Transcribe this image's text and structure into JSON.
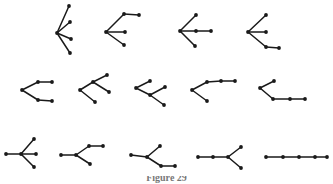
{
  "figure": {
    "caption": "Figure 29",
    "background_color": "#ffffff",
    "ink_color": "#1a1a1a",
    "node_radius": 1.9,
    "edge_width": 1.5,
    "rows": [
      {
        "row_index": 0,
        "tree_count": 4,
        "trees": [
          {
            "id": "tree-1",
            "name": "star-5-branches",
            "nodes": [
              {
                "id": "c",
                "x": 57,
                "y": 33
              },
              {
                "id": "a",
                "x": 69,
                "y": 6
              },
              {
                "id": "b",
                "x": 70,
                "y": 22
              },
              {
                "id": "d",
                "x": 71,
                "y": 39
              },
              {
                "id": "e",
                "x": 70,
                "y": 53
              }
            ],
            "edges": [
              [
                "c",
                "a"
              ],
              [
                "c",
                "b"
              ],
              [
                "c",
                "d"
              ],
              [
                "c",
                "e"
              ]
            ]
          },
          {
            "id": "tree-2",
            "name": "center-three-branches-one-extended-up",
            "nodes": [
              {
                "id": "c",
                "x": 106,
                "y": 32
              },
              {
                "id": "p",
                "x": 124,
                "y": 14
              },
              {
                "id": "q",
                "x": 139,
                "y": 15
              },
              {
                "id": "r",
                "x": 125,
                "y": 32
              },
              {
                "id": "s",
                "x": 124,
                "y": 45
              }
            ],
            "edges": [
              [
                "c",
                "p"
              ],
              [
                "p",
                "q"
              ],
              [
                "c",
                "r"
              ],
              [
                "c",
                "s"
              ]
            ]
          },
          {
            "id": "tree-3",
            "name": "center-three-branches-one-extended-right",
            "nodes": [
              {
                "id": "c",
                "x": 180,
                "y": 31
              },
              {
                "id": "p",
                "x": 196,
                "y": 15
              },
              {
                "id": "r",
                "x": 196,
                "y": 31
              },
              {
                "id": "q",
                "x": 211,
                "y": 31
              },
              {
                "id": "s",
                "x": 195,
                "y": 46
              }
            ],
            "edges": [
              [
                "c",
                "p"
              ],
              [
                "c",
                "r"
              ],
              [
                "r",
                "q"
              ],
              [
                "c",
                "s"
              ]
            ]
          },
          {
            "id": "tree-4",
            "name": "center-three-branches-one-extended-down",
            "nodes": [
              {
                "id": "c",
                "x": 248,
                "y": 32
              },
              {
                "id": "p",
                "x": 266,
                "y": 15
              },
              {
                "id": "r",
                "x": 266,
                "y": 32
              },
              {
                "id": "s",
                "x": 266,
                "y": 47
              },
              {
                "id": "t",
                "x": 279,
                "y": 48
              }
            ],
            "edges": [
              [
                "c",
                "p"
              ],
              [
                "c",
                "r"
              ],
              [
                "c",
                "s"
              ],
              [
                "s",
                "t"
              ]
            ]
          }
        ]
      },
      {
        "row_index": 1,
        "tree_count": 5,
        "trees": [
          {
            "id": "tree-5",
            "name": "double-fork-both-extended",
            "nodes": [
              {
                "id": "c",
                "x": 22,
                "y": 90
              },
              {
                "id": "a",
                "x": 38,
                "y": 82
              },
              {
                "id": "b",
                "x": 52,
                "y": 82
              },
              {
                "id": "d",
                "x": 38,
                "y": 100
              },
              {
                "id": "e",
                "x": 52,
                "y": 101
              }
            ],
            "edges": [
              [
                "c",
                "a"
              ],
              [
                "a",
                "b"
              ],
              [
                "c",
                "d"
              ],
              [
                "d",
                "e"
              ]
            ]
          },
          {
            "id": "tree-6",
            "name": "fork-upper-split",
            "nodes": [
              {
                "id": "c",
                "x": 80,
                "y": 90
              },
              {
                "id": "m",
                "x": 93,
                "y": 82
              },
              {
                "id": "u",
                "x": 107,
                "y": 75
              },
              {
                "id": "v",
                "x": 109,
                "y": 92
              },
              {
                "id": "d",
                "x": 95,
                "y": 102
              }
            ],
            "edges": [
              [
                "c",
                "m"
              ],
              [
                "m",
                "u"
              ],
              [
                "m",
                "v"
              ],
              [
                "c",
                "d"
              ]
            ]
          },
          {
            "id": "tree-7",
            "name": "fork-lower-split",
            "nodes": [
              {
                "id": "c",
                "x": 136,
                "y": 88
              },
              {
                "id": "a",
                "x": 150,
                "y": 81
              },
              {
                "id": "m",
                "x": 150,
                "y": 95
              },
              {
                "id": "u",
                "x": 165,
                "y": 87
              },
              {
                "id": "v",
                "x": 164,
                "y": 105
              }
            ],
            "edges": [
              [
                "c",
                "a"
              ],
              [
                "c",
                "m"
              ],
              [
                "m",
                "u"
              ],
              [
                "m",
                "v"
              ]
            ]
          },
          {
            "id": "tree-8",
            "name": "fork-long-upper-path",
            "nodes": [
              {
                "id": "c",
                "x": 192,
                "y": 90
              },
              {
                "id": "a",
                "x": 207,
                "y": 82
              },
              {
                "id": "b",
                "x": 221,
                "y": 81
              },
              {
                "id": "e",
                "x": 235,
                "y": 81
              },
              {
                "id": "d",
                "x": 207,
                "y": 101
              }
            ],
            "edges": [
              [
                "c",
                "a"
              ],
              [
                "a",
                "b"
              ],
              [
                "b",
                "e"
              ],
              [
                "c",
                "d"
              ]
            ]
          },
          {
            "id": "tree-9",
            "name": "fork-long-lower-path",
            "nodes": [
              {
                "id": "c",
                "x": 260,
                "y": 88
              },
              {
                "id": "a",
                "x": 274,
                "y": 81
              },
              {
                "id": "d",
                "x": 273,
                "y": 99
              },
              {
                "id": "e",
                "x": 290,
                "y": 99
              },
              {
                "id": "f",
                "x": 305,
                "y": 99
              }
            ],
            "edges": [
              [
                "c",
                "a"
              ],
              [
                "c",
                "d"
              ],
              [
                "d",
                "e"
              ],
              [
                "e",
                "f"
              ]
            ]
          }
        ]
      },
      {
        "row_index": 2,
        "tree_count": 5,
        "trees": [
          {
            "id": "tree-10",
            "name": "center-four-branches",
            "nodes": [
              {
                "id": "l",
                "x": 6,
                "y": 154
              },
              {
                "id": "c",
                "x": 21,
                "y": 154
              },
              {
                "id": "u",
                "x": 34,
                "y": 139
              },
              {
                "id": "r",
                "x": 36,
                "y": 154
              },
              {
                "id": "d",
                "x": 34,
                "y": 167
              }
            ],
            "edges": [
              [
                "l",
                "c"
              ],
              [
                "c",
                "u"
              ],
              [
                "c",
                "r"
              ],
              [
                "c",
                "d"
              ]
            ]
          },
          {
            "id": "tree-11",
            "name": "path-then-fork-upper-extended",
            "nodes": [
              {
                "id": "l",
                "x": 61,
                "y": 155
              },
              {
                "id": "c",
                "x": 76,
                "y": 155
              },
              {
                "id": "u",
                "x": 89,
                "y": 146
              },
              {
                "id": "e",
                "x": 103,
                "y": 146
              },
              {
                "id": "d",
                "x": 90,
                "y": 164
              }
            ],
            "edges": [
              [
                "l",
                "c"
              ],
              [
                "c",
                "u"
              ],
              [
                "u",
                "e"
              ],
              [
                "c",
                "d"
              ]
            ]
          },
          {
            "id": "tree-12",
            "name": "path-then-fork-lower-extended",
            "nodes": [
              {
                "id": "l",
                "x": 131,
                "y": 155
              },
              {
                "id": "c",
                "x": 147,
                "y": 157
              },
              {
                "id": "u",
                "x": 160,
                "y": 146
              },
              {
                "id": "d",
                "x": 161,
                "y": 166
              },
              {
                "id": "e",
                "x": 175,
                "y": 166
              }
            ],
            "edges": [
              [
                "l",
                "c"
              ],
              [
                "c",
                "u"
              ],
              [
                "c",
                "d"
              ],
              [
                "d",
                "e"
              ]
            ]
          },
          {
            "id": "tree-13",
            "name": "long-path-then-fork",
            "nodes": [
              {
                "id": "a",
                "x": 198,
                "y": 157
              },
              {
                "id": "b",
                "x": 213,
                "y": 157
              },
              {
                "id": "c",
                "x": 228,
                "y": 157
              },
              {
                "id": "u",
                "x": 241,
                "y": 147
              },
              {
                "id": "d",
                "x": 241,
                "y": 168
              }
            ],
            "edges": [
              [
                "a",
                "b"
              ],
              [
                "b",
                "c"
              ],
              [
                "c",
                "u"
              ],
              [
                "c",
                "d"
              ]
            ]
          },
          {
            "id": "tree-14",
            "name": "path-six-vertices",
            "nodes": [
              {
                "id": "n1",
                "x": 266,
                "y": 157
              },
              {
                "id": "n2",
                "x": 283,
                "y": 157
              },
              {
                "id": "n3",
                "x": 299,
                "y": 157
              },
              {
                "id": "n4",
                "x": 315,
                "y": 157
              },
              {
                "id": "n5",
                "x": 327,
                "y": 157
              }
            ],
            "edges": [
              [
                "n1",
                "n2"
              ],
              [
                "n2",
                "n3"
              ],
              [
                "n3",
                "n4"
              ],
              [
                "n4",
                "n5"
              ]
            ]
          }
        ]
      }
    ]
  }
}
